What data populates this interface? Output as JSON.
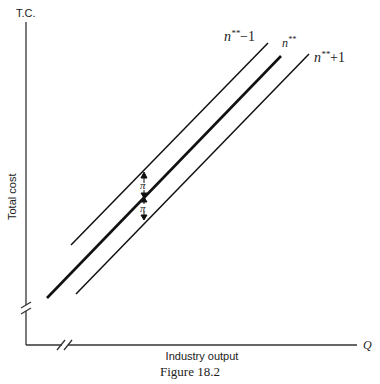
{
  "figure": {
    "caption": "Figure 18.2",
    "y_axis_label_top": "T.C.",
    "y_axis_label_side": "Total cost",
    "x_axis_label": "Industry output",
    "x_axis_end_label": "Q",
    "lines": [
      {
        "name": "n-star-star-minus-1",
        "label_base": "n",
        "label_sup": "**",
        "label_tail": "−1",
        "weight": "thin"
      },
      {
        "name": "n-star-star",
        "label_base": "n",
        "label_sup": "**",
        "label_tail": "",
        "weight": "thick"
      },
      {
        "name": "n-star-star-plus-1",
        "label_base": "n",
        "label_sup": "**",
        "label_tail": "+1",
        "weight": "thin"
      }
    ],
    "gap_labels": [
      "π",
      "π"
    ]
  }
}
